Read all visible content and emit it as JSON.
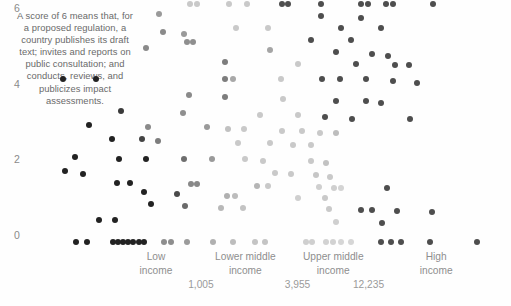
{
  "figure": {
    "background": "#fefefe",
    "annotation": "A score of 6 means that, for a proposed regulation, a country publishes its draft text; invites and reports on public consultation; and conducts, reviews, and publicizes impact assessments."
  },
  "chart_data": {
    "type": "scatter",
    "title": "",
    "xlabel": "",
    "ylabel": "",
    "ylim": [
      0,
      6
    ],
    "xlim": [
      0,
      1
    ],
    "grid": false,
    "legend_position": "none",
    "y_ticks": [
      0,
      2,
      4,
      6
    ],
    "y_tick_labels": [
      "0",
      "2",
      "4",
      "6"
    ],
    "x_group_labels": [
      {
        "line1": "Low",
        "line2": "income",
        "x_frac": 0.265
      },
      {
        "line1": "Lower middle",
        "line2": "income",
        "x_frac": 0.45
      },
      {
        "line1": "Upper middle",
        "line2": "income",
        "x_frac": 0.632
      },
      {
        "line1": "High",
        "line2": "income",
        "x_frac": 0.845
      }
    ],
    "x_threshold_labels": [
      {
        "label": "1,005",
        "x_frac": 0.358
      },
      {
        "label": "3,955",
        "x_frac": 0.558
      },
      {
        "label": "12,235",
        "x_frac": 0.705
      }
    ],
    "colors": {
      "low_income": "#222222",
      "lower_middle": "#7d7d7d",
      "upper_middle": "#c9c9c9",
      "high_income": "#4e4e4e"
    },
    "point_radius_px": 3,
    "points": [
      {
        "x": 0.335,
        "y": 6.0,
        "c": "#c9c9c9"
      },
      {
        "x": 0.349,
        "y": 6.0,
        "c": "#c9c9c9"
      },
      {
        "x": 0.417,
        "y": 6.0,
        "c": "#c9c9c9"
      },
      {
        "x": 0.453,
        "y": 6.0,
        "c": "#c9c9c9"
      },
      {
        "x": 0.525,
        "y": 6.0,
        "c": "#4e4e4e"
      },
      {
        "x": 0.538,
        "y": 6.0,
        "c": "#4e4e4e"
      },
      {
        "x": 0.607,
        "y": 6.0,
        "c": "#4e4e4e"
      },
      {
        "x": 0.69,
        "y": 6.0,
        "c": "#4e4e4e"
      },
      {
        "x": 0.703,
        "y": 6.0,
        "c": "#4e4e4e"
      },
      {
        "x": 0.742,
        "y": 6.0,
        "c": "#4e4e4e"
      },
      {
        "x": 0.755,
        "y": 6.0,
        "c": "#4e4e4e"
      },
      {
        "x": 0.838,
        "y": 6.0,
        "c": "#4e4e4e"
      },
      {
        "x": 0.272,
        "y": 5.75,
        "c": "#9a9a9a"
      },
      {
        "x": 0.607,
        "y": 5.7,
        "c": "#4e4e4e"
      },
      {
        "x": 0.69,
        "y": 5.65,
        "c": "#4e4e4e"
      },
      {
        "x": 0.43,
        "y": 5.4,
        "c": "#c9c9c9"
      },
      {
        "x": 0.497,
        "y": 5.4,
        "c": "#c9c9c9"
      },
      {
        "x": 0.648,
        "y": 5.4,
        "c": "#4e4e4e"
      },
      {
        "x": 0.731,
        "y": 5.4,
        "c": "#4e4e4e"
      },
      {
        "x": 0.28,
        "y": 5.3,
        "c": "#8a8a8a"
      },
      {
        "x": 0.322,
        "y": 5.25,
        "c": "#9a9a9a"
      },
      {
        "x": 0.33,
        "y": 5.05,
        "c": "#8f8f8f"
      },
      {
        "x": 0.342,
        "y": 5.05,
        "c": "#8f8f8f"
      },
      {
        "x": 0.586,
        "y": 5.1,
        "c": "#4e4e4e"
      },
      {
        "x": 0.669,
        "y": 5.1,
        "c": "#4e4e4e"
      },
      {
        "x": 0.245,
        "y": 4.9,
        "c": "#8a8a8a"
      },
      {
        "x": 0.5,
        "y": 4.85,
        "c": "#a5a5a5"
      },
      {
        "x": 0.638,
        "y": 4.8,
        "c": "#4e4e4e"
      },
      {
        "x": 0.713,
        "y": 4.75,
        "c": "#4e4e4e"
      },
      {
        "x": 0.745,
        "y": 4.7,
        "c": "#4e4e4e"
      },
      {
        "x": 0.408,
        "y": 4.55,
        "c": "#7d7d7d"
      },
      {
        "x": 0.56,
        "y": 4.5,
        "c": "#c9c9c9"
      },
      {
        "x": 0.68,
        "y": 4.5,
        "c": "#4e4e4e"
      },
      {
        "x": 0.759,
        "y": 4.45,
        "c": "#4e4e4e"
      },
      {
        "x": 0.788,
        "y": 4.45,
        "c": "#4e4e4e"
      },
      {
        "x": 0.072,
        "y": 4.1,
        "c": "#222222"
      },
      {
        "x": 0.14,
        "y": 4.1,
        "c": "#222222"
      },
      {
        "x": 0.408,
        "y": 4.1,
        "c": "#7d7d7d"
      },
      {
        "x": 0.425,
        "y": 4.1,
        "c": "#a8a8a8"
      },
      {
        "x": 0.523,
        "y": 4.1,
        "c": "#c9c9c9"
      },
      {
        "x": 0.608,
        "y": 4.1,
        "c": "#4e4e4e"
      },
      {
        "x": 0.646,
        "y": 4.1,
        "c": "#4e4e4e"
      },
      {
        "x": 0.7,
        "y": 4.1,
        "c": "#4e4e4e"
      },
      {
        "x": 0.756,
        "y": 4.05,
        "c": "#4e4e4e"
      },
      {
        "x": 0.806,
        "y": 4.0,
        "c": "#4e4e4e"
      },
      {
        "x": 0.333,
        "y": 3.7,
        "c": "#8a8a8a"
      },
      {
        "x": 0.408,
        "y": 3.65,
        "c": "#7d7d7d"
      },
      {
        "x": 0.528,
        "y": 3.6,
        "c": "#c9c9c9"
      },
      {
        "x": 0.638,
        "y": 3.55,
        "c": "#4e4e4e"
      },
      {
        "x": 0.7,
        "y": 3.55,
        "c": "#4e4e4e"
      },
      {
        "x": 0.73,
        "y": 3.5,
        "c": "#4e4e4e"
      },
      {
        "x": 0.192,
        "y": 3.3,
        "c": "#3a3a3a"
      },
      {
        "x": 0.321,
        "y": 3.25,
        "c": "#8f8f8f"
      },
      {
        "x": 0.481,
        "y": 3.2,
        "c": "#c9c9c9"
      },
      {
        "x": 0.56,
        "y": 3.2,
        "c": "#c9c9c9"
      },
      {
        "x": 0.614,
        "y": 3.15,
        "c": "#4e4e4e"
      },
      {
        "x": 0.67,
        "y": 3.1,
        "c": "#4e4e4e"
      },
      {
        "x": 0.79,
        "y": 3.1,
        "c": "#4e4e4e"
      },
      {
        "x": 0.127,
        "y": 2.95,
        "c": "#222222"
      },
      {
        "x": 0.248,
        "y": 2.9,
        "c": "#8a8a8a"
      },
      {
        "x": 0.371,
        "y": 2.9,
        "c": "#9a9a9a"
      },
      {
        "x": 0.415,
        "y": 2.85,
        "c": "#c1c1c1"
      },
      {
        "x": 0.447,
        "y": 2.85,
        "c": "#c9c9c9"
      },
      {
        "x": 0.526,
        "y": 2.8,
        "c": "#c9c9c9"
      },
      {
        "x": 0.568,
        "y": 2.8,
        "c": "#c9c9c9"
      },
      {
        "x": 0.605,
        "y": 2.75,
        "c": "#c9c9c9"
      },
      {
        "x": 0.638,
        "y": 2.75,
        "c": "#bdbdbd"
      },
      {
        "x": 0.173,
        "y": 2.6,
        "c": "#222222"
      },
      {
        "x": 0.236,
        "y": 2.6,
        "c": "#444444"
      },
      {
        "x": 0.27,
        "y": 2.55,
        "c": "#7d7d7d"
      },
      {
        "x": 0.434,
        "y": 2.5,
        "c": "#c9c9c9"
      },
      {
        "x": 0.5,
        "y": 2.5,
        "c": "#c9c9c9"
      },
      {
        "x": 0.549,
        "y": 2.45,
        "c": "#c9c9c9"
      },
      {
        "x": 0.586,
        "y": 2.45,
        "c": "#c9c9c9"
      },
      {
        "x": 0.098,
        "y": 2.15,
        "c": "#222222"
      },
      {
        "x": 0.188,
        "y": 2.1,
        "c": "#222222"
      },
      {
        "x": 0.244,
        "y": 2.1,
        "c": "#222222"
      },
      {
        "x": 0.323,
        "y": 2.1,
        "c": "#6e6e6e"
      },
      {
        "x": 0.381,
        "y": 2.1,
        "c": "#9a9a9a"
      },
      {
        "x": 0.449,
        "y": 2.1,
        "c": "#c9c9c9"
      },
      {
        "x": 0.486,
        "y": 2.05,
        "c": "#c9c9c9"
      },
      {
        "x": 0.585,
        "y": 2.05,
        "c": "#c9c9c9"
      },
      {
        "x": 0.618,
        "y": 2.0,
        "c": "#c2c2c2"
      },
      {
        "x": 0.076,
        "y": 1.8,
        "c": "#222222"
      },
      {
        "x": 0.113,
        "y": 1.72,
        "c": "#222222"
      },
      {
        "x": 0.512,
        "y": 1.75,
        "c": "#c9c9c9"
      },
      {
        "x": 0.545,
        "y": 1.72,
        "c": "#c9c9c9"
      },
      {
        "x": 0.596,
        "y": 1.68,
        "c": "#c6c6c6"
      },
      {
        "x": 0.625,
        "y": 1.65,
        "c": "#c9c9c9"
      },
      {
        "x": 0.184,
        "y": 1.5,
        "c": "#222222"
      },
      {
        "x": 0.212,
        "y": 1.5,
        "c": "#222222"
      },
      {
        "x": 0.338,
        "y": 1.45,
        "c": "#888888"
      },
      {
        "x": 0.35,
        "y": 1.45,
        "c": "#888888"
      },
      {
        "x": 0.475,
        "y": 1.4,
        "c": "#b5b5b5"
      },
      {
        "x": 0.497,
        "y": 1.4,
        "c": "#c9c9c9"
      },
      {
        "x": 0.602,
        "y": 1.38,
        "c": "#cfcfcf"
      },
      {
        "x": 0.633,
        "y": 1.35,
        "c": "#cfcfcf"
      },
      {
        "x": 0.648,
        "y": 1.35,
        "c": "#d4d4d4"
      },
      {
        "x": 0.744,
        "y": 1.35,
        "c": "#4e4e4e"
      },
      {
        "x": 0.241,
        "y": 1.25,
        "c": "#222222"
      },
      {
        "x": 0.308,
        "y": 1.2,
        "c": "#4a4a4a"
      },
      {
        "x": 0.413,
        "y": 1.15,
        "c": "#b0b0b0"
      },
      {
        "x": 0.428,
        "y": 1.15,
        "c": "#bcbcbc"
      },
      {
        "x": 0.56,
        "y": 1.12,
        "c": "#cfcfcf"
      },
      {
        "x": 0.615,
        "y": 1.1,
        "c": "#c9c9c9"
      },
      {
        "x": 0.254,
        "y": 0.95,
        "c": "#222222"
      },
      {
        "x": 0.326,
        "y": 0.9,
        "c": "#6a6a6a"
      },
      {
        "x": 0.4,
        "y": 0.85,
        "c": "#b8b8b8"
      },
      {
        "x": 0.445,
        "y": 0.85,
        "c": "#c3c3c3"
      },
      {
        "x": 0.623,
        "y": 0.82,
        "c": "#c9c9c9"
      },
      {
        "x": 0.69,
        "y": 0.8,
        "c": "#4e4e4e"
      },
      {
        "x": 0.712,
        "y": 0.8,
        "c": "#4e4e4e"
      },
      {
        "x": 0.763,
        "y": 0.78,
        "c": "#4e4e4e"
      },
      {
        "x": 0.836,
        "y": 0.75,
        "c": "#4e4e4e"
      },
      {
        "x": 0.148,
        "y": 0.55,
        "c": "#222222"
      },
      {
        "x": 0.18,
        "y": 0.55,
        "c": "#222222"
      },
      {
        "x": 0.637,
        "y": 0.5,
        "c": "#cfcfcf"
      },
      {
        "x": 0.732,
        "y": 0.48,
        "c": "#4e4e4e"
      },
      {
        "x": 0.1,
        "y": 0.0,
        "c": "#222222"
      },
      {
        "x": 0.122,
        "y": 0.0,
        "c": "#222222"
      },
      {
        "x": 0.175,
        "y": 0.0,
        "c": "#222222"
      },
      {
        "x": 0.186,
        "y": 0.0,
        "c": "#222222"
      },
      {
        "x": 0.197,
        "y": 0.0,
        "c": "#222222"
      },
      {
        "x": 0.207,
        "y": 0.0,
        "c": "#222222"
      },
      {
        "x": 0.218,
        "y": 0.0,
        "c": "#222222"
      },
      {
        "x": 0.229,
        "y": 0.0,
        "c": "#222222"
      },
      {
        "x": 0.24,
        "y": 0.0,
        "c": "#222222"
      },
      {
        "x": 0.282,
        "y": 0.0,
        "c": "#8e8e8e"
      },
      {
        "x": 0.296,
        "y": 0.0,
        "c": "#8e8e8e"
      },
      {
        "x": 0.33,
        "y": 0.0,
        "c": "#9b9b9b"
      },
      {
        "x": 0.382,
        "y": 0.0,
        "c": "#b0b0b0"
      },
      {
        "x": 0.425,
        "y": 0.0,
        "c": "#bdbdbd"
      },
      {
        "x": 0.47,
        "y": 0.0,
        "c": "#c4c4c4"
      },
      {
        "x": 0.49,
        "y": 0.0,
        "c": "#c4c4c4"
      },
      {
        "x": 0.575,
        "y": 0.0,
        "c": "#cfcfcf"
      },
      {
        "x": 0.589,
        "y": 0.0,
        "c": "#cfcfcf"
      },
      {
        "x": 0.618,
        "y": 0.0,
        "c": "#d2d2d2"
      },
      {
        "x": 0.632,
        "y": 0.0,
        "c": "#d2d2d2"
      },
      {
        "x": 0.648,
        "y": 0.0,
        "c": "#d6d6d6"
      },
      {
        "x": 0.669,
        "y": 0.0,
        "c": "#d6d6d6"
      },
      {
        "x": 0.73,
        "y": 0.0,
        "c": "#4e4e4e"
      },
      {
        "x": 0.752,
        "y": 0.0,
        "c": "#4e4e4e"
      },
      {
        "x": 0.772,
        "y": 0.0,
        "c": "#4e4e4e"
      },
      {
        "x": 0.833,
        "y": 0.0,
        "c": "#4e4e4e"
      },
      {
        "x": 0.93,
        "y": 0.0,
        "c": "#4e4e4e"
      }
    ]
  }
}
